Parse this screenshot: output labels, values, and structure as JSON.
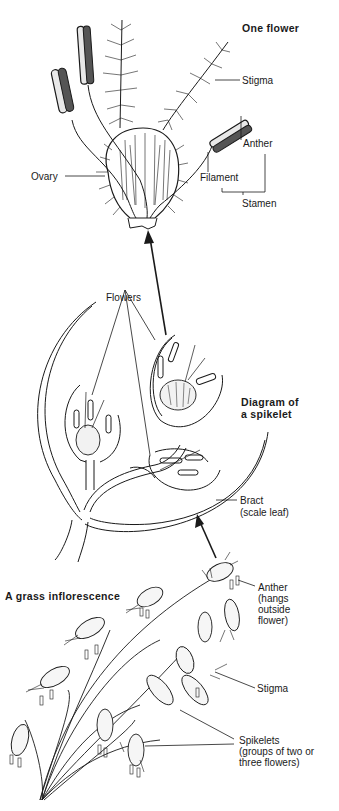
{
  "section_one_flower": {
    "title": "One flower",
    "labels": {
      "stigma": "Stigma",
      "anther": "Anther",
      "ovary": "Ovary",
      "filament": "Filament",
      "stamen": "Stamen"
    }
  },
  "section_spikelet": {
    "title_line1": "Diagram of",
    "title_line2": "a spikelet",
    "labels": {
      "flowers": "Flowers",
      "bract_line1": "Bract",
      "bract_line2": "(scale leaf)"
    }
  },
  "section_inflorescence": {
    "title": "A grass inflorescence",
    "labels": {
      "anther_line1": "Anther",
      "anther_line2": "(hangs",
      "anther_line3": "outside",
      "anther_line4": "flower)",
      "stigma": "Stigma",
      "spikelets_line1": "Spikelets",
      "spikelets_line2": "(groups of two or",
      "spikelets_line3": "three flowers)"
    }
  },
  "colors": {
    "ink": "#1a1a1a",
    "background": "#ffffff"
  }
}
